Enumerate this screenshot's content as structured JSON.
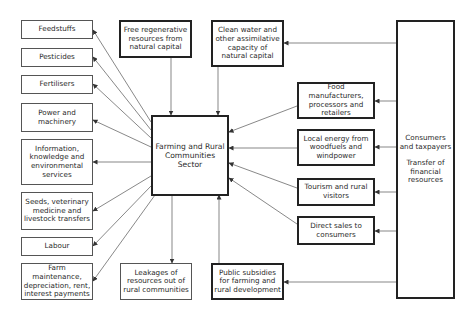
{
  "diagram": {
    "center": {
      "label": "Farming and Rural Communities Sector"
    },
    "left_outputs": [
      {
        "id": "feedstuffs",
        "label": "Feedstuffs"
      },
      {
        "id": "pesticides",
        "label": "Pesticides"
      },
      {
        "id": "fertilisers",
        "label": "Fertilisers"
      },
      {
        "id": "power",
        "label": "Power and machinery"
      },
      {
        "id": "information",
        "label": "Information, knowledge and environmental services"
      },
      {
        "id": "seeds",
        "label": "Seeds, veterinary medicine and livestock transfers"
      },
      {
        "id": "labour",
        "label": "Labour"
      },
      {
        "id": "maintenance",
        "label": "Farm maintenance, depreciation, rent, interest payments"
      }
    ],
    "top": {
      "free_resources": "Free regenerative resources from natural capital",
      "clean_water": "Clean water and other assimilative capacity of natural capital"
    },
    "bottom": {
      "leakages": "Leakages of resources out of rural communities",
      "subsidies": "Public subsidies for farming and rural development"
    },
    "right_inputs": [
      {
        "id": "food",
        "label": "Food manufacturers, processors and retailers"
      },
      {
        "id": "energy",
        "label": "Local energy from woodfuels and windpower"
      },
      {
        "id": "tourism",
        "label": "Tourism and rural visitors"
      },
      {
        "id": "direct",
        "label": "Direct sales to consumers"
      }
    ],
    "consumers": {
      "title": "Consumers and taxpayers",
      "subtitle": "Transfer of financial resources"
    }
  }
}
